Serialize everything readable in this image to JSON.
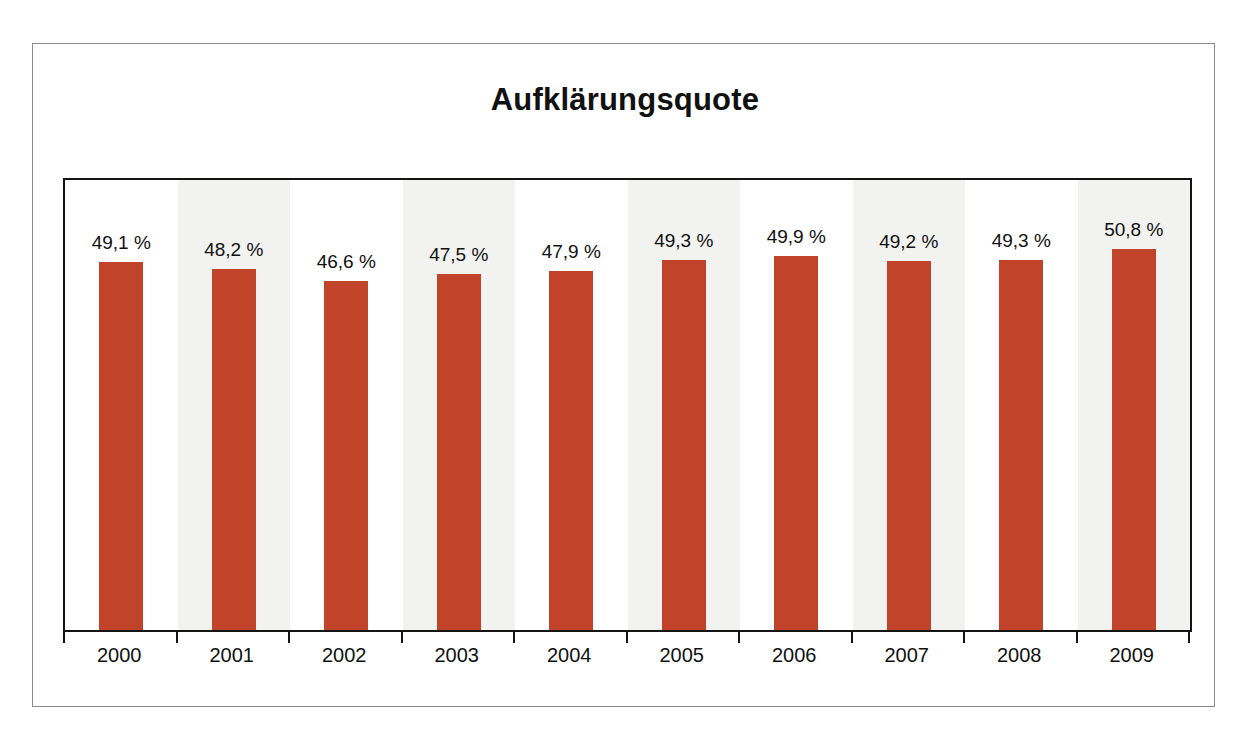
{
  "chart_data": {
    "type": "bar",
    "title": "Aufklärungsquote",
    "xlabel": "",
    "ylabel": "",
    "grid": false,
    "legend": "none",
    "axis_min": 0,
    "axis_max": 60,
    "value_suffix": " %",
    "bar_color": "#c0432a",
    "band_color": "#f2f2f0",
    "categories": [
      "2000",
      "2001",
      "2002",
      "2003",
      "2004",
      "2005",
      "2006",
      "2007",
      "2008",
      "2009"
    ],
    "values": [
      49.1,
      48.2,
      46.6,
      47.5,
      47.9,
      49.3,
      49.9,
      49.2,
      49.3,
      50.8
    ],
    "value_labels": [
      "49,1 %",
      "48,2 %",
      "46,6 %",
      "47,5 %",
      "47,9 %",
      "49,3 %",
      "49,9 %",
      "49,2 %",
      "49,3 %",
      "50,8 %"
    ]
  },
  "page": {
    "cutoff_text": ""
  }
}
